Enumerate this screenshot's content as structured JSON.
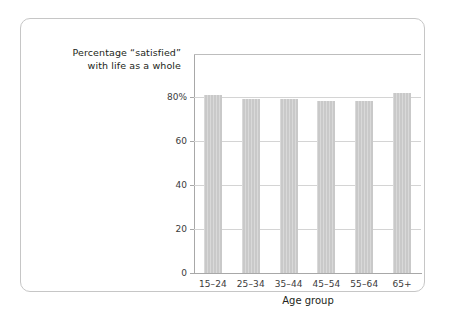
{
  "title": {
    "line1": "Percentage “satisfied”",
    "line2": "with life as a whole"
  },
  "axes": {
    "x_title": "Age group",
    "y_tick_labels": [
      "0",
      "20",
      "40",
      "60",
      "80%"
    ]
  },
  "colors": {
    "bar": "#c9c9c9",
    "grid": "#d4d4d4",
    "axis": "#a8a8a8",
    "frame": "#c6c6c6",
    "text": "#231f20"
  },
  "chart_data": {
    "type": "bar",
    "title": "Percentage “satisfied” with life as a whole",
    "xlabel": "Age group",
    "ylabel": "",
    "categories": [
      "15–24",
      "25–34",
      "35–44",
      "45–54",
      "55–64",
      "65+"
    ],
    "values": [
      81,
      79,
      79,
      78,
      78,
      82
    ],
    "ylim": [
      0,
      99.5
    ],
    "yticks": [
      0,
      20,
      40,
      60,
      80
    ],
    "ytick_labels": [
      "0",
      "20",
      "40",
      "60",
      "80%"
    ],
    "grid": true,
    "legend": false
  }
}
